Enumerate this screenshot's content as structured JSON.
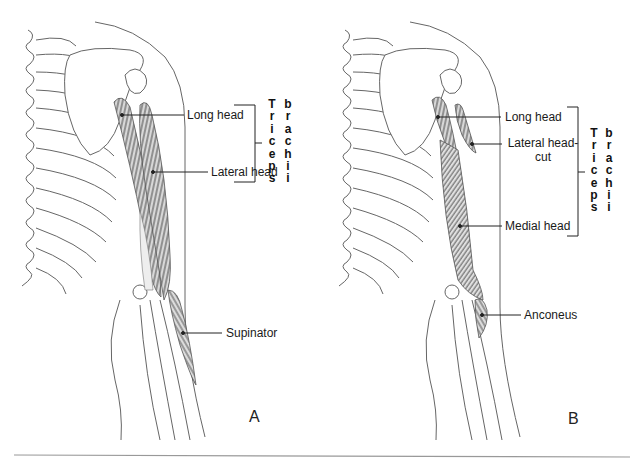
{
  "figure": {
    "panels": [
      {
        "id": "A",
        "letter": "A",
        "labels": {
          "long_head": "Long head",
          "lateral_head": "Lateral head",
          "supinator": "Supinator"
        },
        "group_label": {
          "word1": [
            "T",
            "r",
            "i",
            "c",
            "e",
            "p",
            "s"
          ],
          "word2": [
            "b",
            "r",
            "a",
            "c",
            "h",
            "i",
            "i"
          ]
        }
      },
      {
        "id": "B",
        "letter": "B",
        "labels": {
          "long_head": "Long head",
          "lateral_head_cut_line1": "Lateral head-",
          "lateral_head_cut_line2": "cut",
          "medial_head": "Medial head",
          "anconeus": "Anconeus"
        },
        "group_label": {
          "word1": [
            "T",
            "r",
            "i",
            "c",
            "e",
            "p",
            "s"
          ],
          "word2": [
            "b",
            "r",
            "a",
            "c",
            "h",
            "i",
            "i"
          ]
        }
      }
    ],
    "colors": {
      "line": "#555555",
      "muscle": "#6e6e6e",
      "text": "#1a1a1a",
      "rule": "#999999"
    }
  }
}
